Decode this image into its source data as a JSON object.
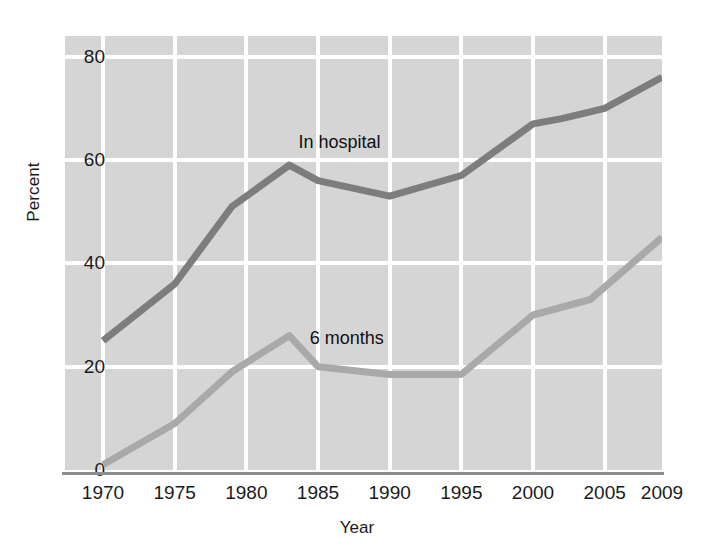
{
  "chart_data": {
    "type": "line",
    "title": "",
    "xlabel": "Year",
    "ylabel": "Percent",
    "xlim": [
      1970,
      2009
    ],
    "ylim": [
      0,
      84
    ],
    "grid": true,
    "grid_color": "#ffffff",
    "plot_background": "#d5d5d5",
    "legend_position": "inline-annotations",
    "yticks": [
      80,
      60,
      40,
      20,
      0
    ],
    "xticks": [
      1970,
      1975,
      1980,
      1985,
      1990,
      1995,
      2000,
      2005,
      2009
    ],
    "ytick_labels": [
      "80",
      "60",
      "40",
      "20",
      "0"
    ],
    "xtick_labels": [
      "1970",
      "1975",
      "1980",
      "1985",
      "1990",
      "1995",
      "2000",
      "2005",
      "2009"
    ],
    "annotations": [
      {
        "text": "In hospital",
        "x": 1986.5,
        "y": 63.5
      },
      {
        "text": "6 months",
        "x": 1987.0,
        "y": 25.5
      }
    ],
    "series": [
      {
        "name": "In hospital",
        "color": "#7d7d7d",
        "line_width": 7,
        "x": [
          1970,
          1975,
          1979,
          1983,
          1985,
          1990,
          1995,
          2000,
          2002,
          2005,
          2009
        ],
        "values": [
          25,
          36,
          51,
          59,
          56,
          53,
          57,
          67,
          68,
          70,
          76
        ]
      },
      {
        "name": "6 months",
        "color": "#a9a9a9",
        "line_width": 7,
        "x": [
          1970,
          1975,
          1979,
          1983,
          1985,
          1990,
          1995,
          2000,
          2004,
          2009
        ],
        "values": [
          1,
          9,
          19,
          26,
          20,
          18.5,
          18.5,
          30,
          33,
          45
        ]
      }
    ]
  }
}
